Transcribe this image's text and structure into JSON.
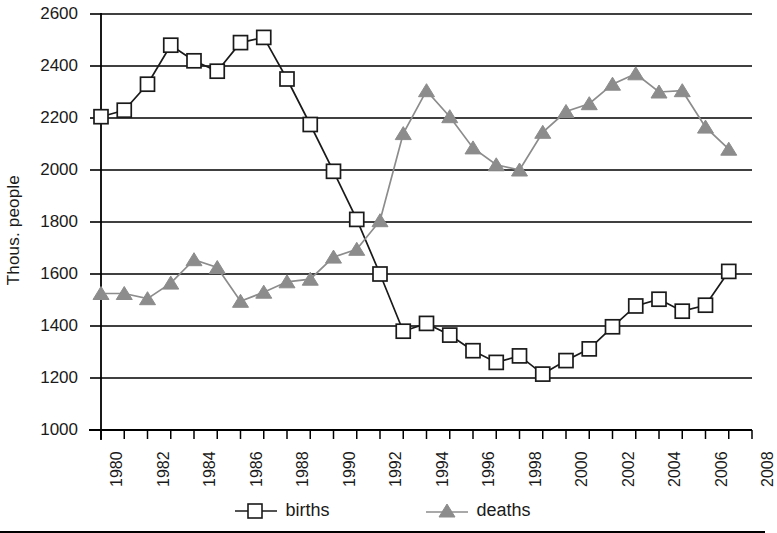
{
  "chart_data": {
    "type": "line",
    "title": "",
    "xlabel": "",
    "ylabel": "Thous. people",
    "x": [
      1980,
      1981,
      1982,
      1983,
      1984,
      1985,
      1986,
      1987,
      1988,
      1989,
      1990,
      1991,
      1992,
      1993,
      1994,
      1995,
      1996,
      1997,
      1998,
      1999,
      2000,
      2001,
      2002,
      2003,
      2004,
      2005,
      2006,
      2007
    ],
    "xtick_labels": [
      "1980",
      "1982",
      "1984",
      "1986",
      "1988",
      "1990",
      "1992",
      "1994",
      "1996",
      "1998",
      "2000",
      "2002",
      "2004",
      "2006",
      "2008"
    ],
    "xlim": [
      1980,
      2008
    ],
    "ylim": [
      1000,
      2600
    ],
    "ytick_labels": [
      "2600",
      "2400",
      "2200",
      "2000",
      "1800",
      "1600",
      "1400",
      "1200",
      "1000"
    ],
    "yticks": [
      2600,
      2400,
      2200,
      2000,
      1800,
      1600,
      1400,
      1200,
      1000
    ],
    "grid": "horizontal",
    "legend_position": "bottom",
    "series": [
      {
        "name": "births",
        "marker": "open-square",
        "color": "#1a1a1a",
        "values": [
          2205,
          2230,
          2330,
          2480,
          2420,
          2380,
          2490,
          2510,
          2350,
          2175,
          1995,
          1810,
          1600,
          1380,
          1410,
          1365,
          1305,
          1260,
          1285,
          1215,
          1267,
          1312,
          1397,
          1477,
          1503,
          1457,
          1480,
          1610
        ]
      },
      {
        "name": "deaths",
        "marker": "filled-triangle",
        "color": "#8c8c8c",
        "values": [
          1525,
          1525,
          1505,
          1565,
          1655,
          1625,
          1495,
          1530,
          1570,
          1580,
          1665,
          1695,
          1805,
          2140,
          2305,
          2205,
          2085,
          2020,
          2000,
          2145,
          2225,
          2255,
          2330,
          2370,
          2300,
          2305,
          2165,
          2080
        ]
      }
    ]
  },
  "legend": {
    "births_label": "births",
    "deaths_label": "deaths"
  },
  "colors": {
    "births": "#1a1a1a",
    "deaths": "#8c8c8c",
    "grid": "#000000",
    "axis": "#000000"
  }
}
